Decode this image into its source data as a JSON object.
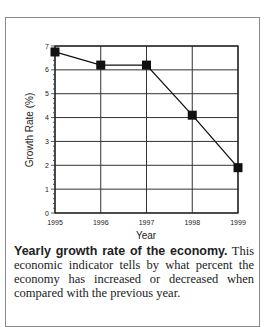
{
  "chart_data": {
    "type": "line",
    "title": "",
    "xlabel": "Year",
    "ylabel": "Growth Rate (%)",
    "categories": [
      "1995",
      "1996",
      "1997",
      "1998",
      "1999"
    ],
    "series": [
      {
        "name": "Growth Rate",
        "values": [
          6.75,
          6.2,
          6.2,
          4.1,
          1.9
        ]
      }
    ],
    "ylim": [
      0,
      7
    ],
    "yticks": [
      "0",
      "1",
      "2",
      "3",
      "4",
      "5",
      "6",
      "7"
    ],
    "grid": true,
    "marker": "square"
  },
  "caption": {
    "bold": "Yearly growth rate of the economy.",
    "text": " This economic indicator tells by what percent the economy has increased or decreased when compared with the previous year."
  }
}
